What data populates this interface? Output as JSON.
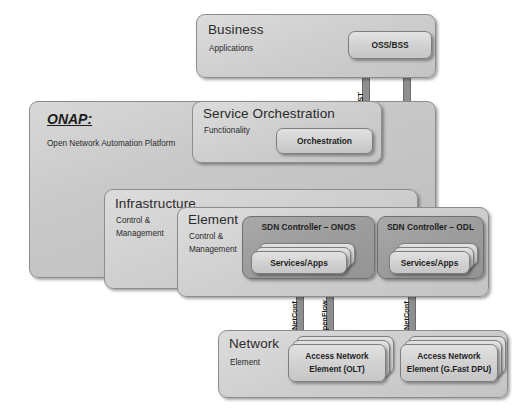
{
  "diagram": {
    "colors": {
      "box_fill": "#c9c9c9",
      "box_fill_dark": "#9d9d9d",
      "box_fill_light": "#d8d8d8",
      "border": "#8d8d8d",
      "arrow": "#8c8c8c",
      "arrow_border": "#6a6a6a",
      "text": "#1f1f1f",
      "background": "#ffffff"
    }
  },
  "business": {
    "title": "Business",
    "subtitle": "Applications",
    "oss_bss": "OSS/BSS"
  },
  "onap": {
    "title": "ONAP:",
    "subtitle": "Open Network Automation Platform"
  },
  "service_orchestration": {
    "title": "Service Orchestration",
    "subtitle": "Functionality",
    "orchestration": "Orchestration"
  },
  "infrastructure": {
    "title": "Infrastructure",
    "subtitle_line1": "Control &",
    "subtitle_line2": "Management"
  },
  "element": {
    "title": "Element",
    "subtitle_line1": "Control &",
    "subtitle_line2": "Management"
  },
  "controllers": [
    {
      "title": "SDN Controller – ONOS",
      "services": "Services/Apps"
    },
    {
      "title": "SDN Controller – ODL",
      "services": "Services/Apps"
    }
  ],
  "network": {
    "title": "Network",
    "subtitle": "Element",
    "elements": [
      {
        "line1": "Access Network",
        "line2": "Element (OLT)"
      },
      {
        "line1": "Access Network",
        "line2": "Element (G.Fast DPU)"
      }
    ]
  },
  "connectors": [
    {
      "id": "rest-oss-orchestration",
      "label": "REST",
      "direction": "bidirectional",
      "from": "Orchestration",
      "to": "OSS/BSS"
    },
    {
      "id": "rest-oss-odl",
      "label": "REST",
      "direction": "bidirectional",
      "from": "SDN Controller – ODL",
      "to": "OSS/BSS"
    },
    {
      "id": "api-orchestration-onos",
      "label": "API",
      "direction": "bidirectional",
      "from": "Orchestration",
      "to": "SDN Controller – ONOS"
    },
    {
      "id": "rest-orchestration-onos",
      "label": "REST",
      "direction": "bidirectional",
      "from": "Orchestration",
      "to": "SDN Controller – ONOS"
    },
    {
      "id": "netconf-onos-olt",
      "label": "NetConf",
      "direction": "bidirectional",
      "from": "SDN Controller – ONOS",
      "to": "Access Network Element (OLT)"
    },
    {
      "id": "openflow-onos-olt",
      "label": "OpenFlow",
      "direction": "bidirectional",
      "from": "SDN Controller – ONOS",
      "to": "Access Network Element (OLT)"
    },
    {
      "id": "netconf-odl-dpu",
      "label": "NetConf",
      "direction": "bidirectional",
      "from": "SDN Controller – ODL",
      "to": "Access Network Element (G.Fast DPU)"
    }
  ]
}
